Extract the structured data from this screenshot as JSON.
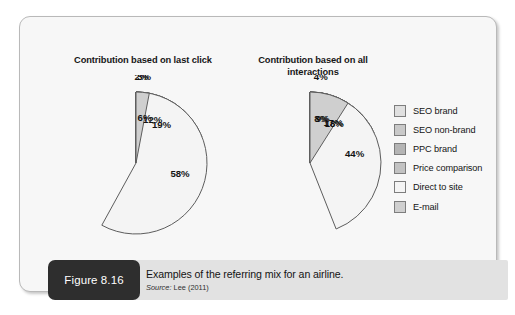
{
  "figure": {
    "tag": "Figure 8.16",
    "caption": "Examples of the referring mix for an airline.",
    "source_prefix": "Source:",
    "source_value": "Lee (2011)"
  },
  "legend": {
    "items": [
      {
        "label": "SEO brand",
        "color": "#e0e0e0"
      },
      {
        "label": "SEO non-brand",
        "color": "#c9c9c9"
      },
      {
        "label": "PPC brand",
        "color": "#b4b4b4"
      },
      {
        "label": "Price comparison",
        "color": "#c2c2c2"
      },
      {
        "label": "Direct to site",
        "color": "#f4f4f4"
      },
      {
        "label": "E-mail",
        "color": "#cfcfcf"
      }
    ]
  },
  "chart_data": [
    {
      "type": "pie",
      "title": "Contribution based on last click",
      "categories": [
        "SEO brand",
        "SEO non-brand",
        "PPC brand",
        "Price comparison",
        "Direct to site",
        "E-mail"
      ],
      "values": [
        19,
        2,
        12,
        6,
        58,
        3
      ],
      "labels": [
        "19%",
        "2%",
        "12%",
        "6%",
        "58%",
        "3%"
      ],
      "colors": [
        "#e0e0e0",
        "#c9c9c9",
        "#b4b4b4",
        "#c2c2c2",
        "#f4f4f4",
        "#cfcfcf"
      ],
      "unit": "%",
      "start_angle_deg": 0,
      "direction": "clockwise",
      "legend_position": "right",
      "label_placement": [
        "inside",
        "outside",
        "inside",
        "inside",
        "inside",
        "outside"
      ]
    },
    {
      "type": "pie",
      "title": "Contribution based on all interactions",
      "categories": [
        "SEO brand",
        "SEO non-brand",
        "PPC brand",
        "Price comparison",
        "Direct to site",
        "E-mail"
      ],
      "values": [
        18,
        4,
        17,
        8,
        44,
        9
      ],
      "labels": [
        "18%",
        "4%",
        "17%",
        "8%",
        "44%",
        "9%"
      ],
      "colors": [
        "#e0e0e0",
        "#c9c9c9",
        "#b4b4b4",
        "#c2c2c2",
        "#f4f4f4",
        "#cfcfcf"
      ],
      "unit": "%",
      "start_angle_deg": 0,
      "direction": "clockwise",
      "legend_position": "right",
      "label_placement": [
        "inside",
        "outside",
        "inside",
        "inside",
        "inside",
        "inside"
      ]
    }
  ]
}
